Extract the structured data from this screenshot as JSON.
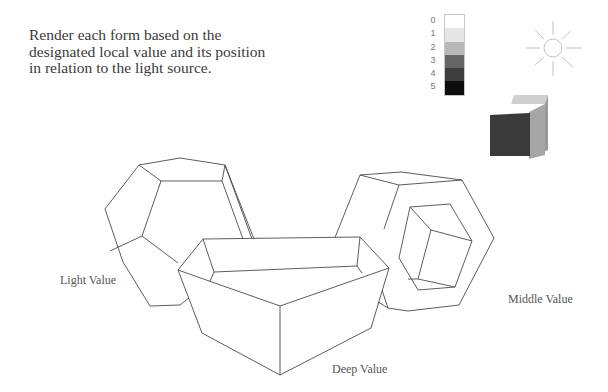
{
  "instruction": "Render each form based on the designated local value and its position in relation to the light source.",
  "value_scale": {
    "labels": [
      "0",
      "1",
      "2",
      "3",
      "4",
      "5"
    ],
    "colors": [
      "#ffffff",
      "#e6e6e6",
      "#b8b8b8",
      "#666666",
      "#3e3e3e",
      "#0e0e0e"
    ]
  },
  "light_source": {
    "icon": "sun-icon",
    "color": "#bdbdbd"
  },
  "example_cube": {
    "front_color": "#3a3a3a",
    "side_color": "#9a9a9a",
    "top_color": "#cfcfcf"
  },
  "forms": [
    {
      "name": "dodecahedron",
      "label": "Light Value"
    },
    {
      "name": "pentagonal-tray",
      "label": "Deep Value"
    },
    {
      "name": "hexagonal-ring",
      "label": "Middle Value"
    }
  ],
  "line_color": "#444444"
}
